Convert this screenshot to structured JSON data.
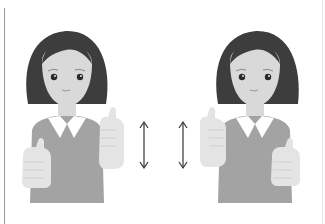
{
  "illustration": {
    "description": "Two identical cartoon women side by side, each holding two thumbs-up hands in front of the chest, with vertical double-headed arrows between them indicating up-and-down movement",
    "colors": {
      "background": "#ffffff",
      "hair": "#3d3d3d",
      "skin": "#d9d9d9",
      "dress": "#a3a3a3",
      "collar": "#ffffff",
      "hand": "#e4e4e4",
      "hand_shadow": "#cfcfcf",
      "eye": "#2a2a2a",
      "arrow": "#333333",
      "border_line": "#9a9a9a"
    },
    "figures": [
      {
        "name": "left-figure",
        "gesture": "thumbs-up both hands, raised right hand"
      },
      {
        "name": "right-figure",
        "gesture": "thumbs-up both hands, raised left hand"
      }
    ],
    "arrows": [
      {
        "name": "up-down-arrow-left",
        "direction": "vertical double-headed"
      },
      {
        "name": "up-down-arrow-right",
        "direction": "vertical double-headed"
      }
    ]
  }
}
